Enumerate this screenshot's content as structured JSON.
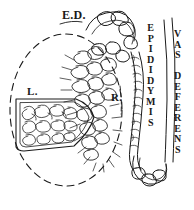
{
  "figure": {
    "kind": "anatomical-line-drawing",
    "background_color": "#ffffff",
    "ink_color": "#1a1a1a"
  },
  "labels": {
    "efferent_ducts": "E.D.",
    "lobule": "L.",
    "rete_testis": "R.",
    "epididymis": "EPIDIDYMIS",
    "vas_deferens": "VAS DEFERENS"
  },
  "structures": [
    {
      "name": "testis-outline",
      "style": "dashed-ellipse"
    },
    {
      "name": "lobule-wedge",
      "style": "solid-outline-with-coiled-tubules"
    },
    {
      "name": "rete-testis",
      "style": "network-of-tubules"
    },
    {
      "name": "efferent-ducts",
      "style": "coiled-tubules"
    },
    {
      "name": "epididymis-duct",
      "style": "long-coiled-tube"
    },
    {
      "name": "vas-deferens-tube",
      "style": "two-parallel-lines"
    }
  ]
}
